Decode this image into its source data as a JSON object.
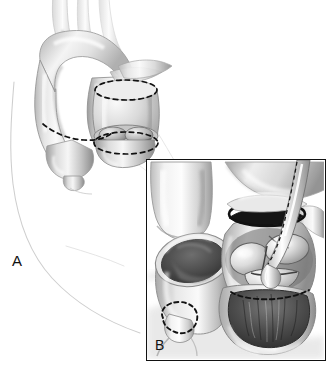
{
  "figure": {
    "kind": "medical-illustration",
    "background_color": "#ffffff",
    "width": 333,
    "height": 370,
    "style": "grayscale pen-and-ink with airbrush shading"
  },
  "panels": [
    {
      "id": "A",
      "label": "A",
      "label_position": {
        "x": 12,
        "y": 253
      },
      "description": "Overview: aortic arch with three brachiocephalic branches, ascending aorta and pulmonary trunk marked with dashed transection lines, seen through a faint chest-wall contour."
    },
    {
      "id": "B",
      "label": "B",
      "label_position": {
        "x": 155,
        "y": 338
      },
      "description": "Inset close-up: transected pulmonary artery stump on the left and opened aortic root showing three valve cusps with a surgical retractor on the right.",
      "frame": {
        "x": 146,
        "y": 159,
        "width": 180,
        "height": 202
      }
    }
  ],
  "panel_a": {
    "structures": [
      {
        "name": "aortic-arch",
        "label": "Aortic arch"
      },
      {
        "name": "brachiocephalic-trunk",
        "label": "Brachiocephalic trunk"
      },
      {
        "name": "left-common-carotid-artery",
        "label": "Left common carotid artery"
      },
      {
        "name": "left-subclavian-artery",
        "label": "Left subclavian artery"
      },
      {
        "name": "descending-aorta",
        "label": "Descending aorta"
      },
      {
        "name": "ascending-aorta",
        "label": "Ascending aorta"
      },
      {
        "name": "pulmonary-trunk",
        "label": "Pulmonary trunk"
      },
      {
        "name": "aortic-root",
        "label": "Aortic root"
      },
      {
        "name": "right-coronary-artery",
        "label": "Right coronary artery"
      },
      {
        "name": "chest-wall-contour",
        "label": "Chest wall contour"
      }
    ],
    "dashed_lines": [
      {
        "name": "pulmonary-transection-line",
        "label": "Pulmonary artery transection line"
      },
      {
        "name": "ascending-aorta-upper-transection-line",
        "label": "Ascending aorta proximal transection line"
      },
      {
        "name": "aortic-root-transection-line",
        "label": "Aortic root transection line"
      }
    ]
  },
  "panel_b": {
    "structures": [
      {
        "name": "pulmonary-artery-stump",
        "label": "Pulmonary artery stump"
      },
      {
        "name": "pulmonary-artery-lumen",
        "label": "Pulmonary artery lumen"
      },
      {
        "name": "divided-ascending-aorta",
        "label": "Divided ascending aorta"
      },
      {
        "name": "aortic-root",
        "label": "Aortic root"
      },
      {
        "name": "aortic-valve-cusp-left",
        "label": "Left coronary cusp"
      },
      {
        "name": "aortic-valve-cusp-right",
        "label": "Right coronary cusp"
      },
      {
        "name": "aortic-valve-cusp-non-coronary",
        "label": "Non-coronary cusp"
      },
      {
        "name": "left-ventricular-outflow-tract",
        "label": "Left ventricular outflow tract"
      },
      {
        "name": "surgical-retractor",
        "label": "Surgical retractor"
      },
      {
        "name": "coronary-button-marking",
        "label": "Coronary button marking"
      }
    ],
    "dashed_lines": [
      {
        "name": "coronary-button-dashed-circle",
        "label": "Coronary ostium button outline"
      },
      {
        "name": "annulus-dashed-line",
        "label": "Aortic annulus dashed line"
      },
      {
        "name": "retractor-dashed-edge",
        "label": "Retractor shaft dashed edge"
      }
    ]
  },
  "palette": {
    "background": "#ffffff",
    "ink": "#111111",
    "outline": "#6e6e6e",
    "contour_faint": "#b8b8b8",
    "tissue_light": "#f2f2f2",
    "tissue_mid": "#c9c9c9",
    "tissue_dark": "#8a8a8a",
    "lumen_dark": "#3a3a3a",
    "lumen_black": "#1a1a1a",
    "highlight": "#fbfbfb",
    "frame_border": "#111111"
  }
}
